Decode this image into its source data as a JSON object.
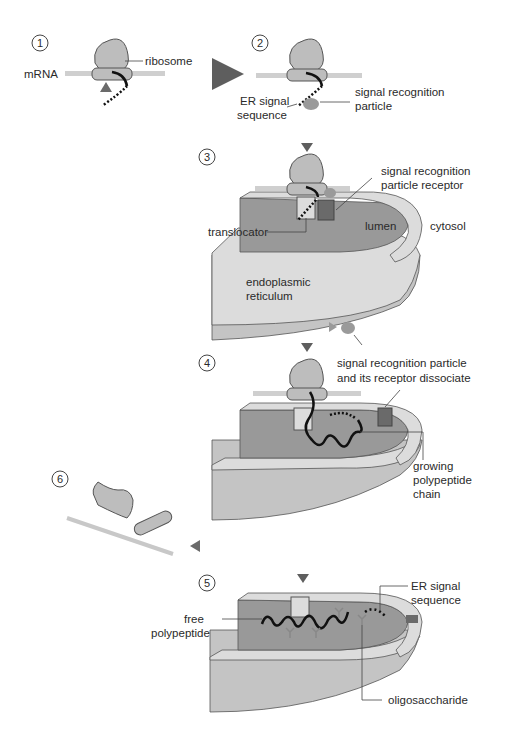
{
  "diagram": {
    "type": "process-flow",
    "colors": {
      "ribosome": "#bdbdbd",
      "mrna": "#c8c8c8",
      "srp": "#9a9a9a",
      "lumen": "#999999",
      "membrane_light": "#dcdcdc",
      "er_body": "#c4c4c4",
      "receptor": "#6a6a6a",
      "arrow": "#6e6e6e",
      "text": "#2a2a2a"
    },
    "steps": [
      {
        "number": "1",
        "labels": {
          "mrna": "mRNA",
          "ribosome": "ribosome"
        }
      },
      {
        "number": "2",
        "labels": {
          "er_signal": "ER signal",
          "er_signal_2": "sequence",
          "srp": "signal recognition",
          "srp_2": "particle"
        }
      },
      {
        "number": "3",
        "labels": {
          "receptor": "signal recognition",
          "receptor_2": "particle receptor",
          "translocator": "translocator",
          "lumen": "lumen",
          "cytosol": "cytosol",
          "er": "endoplasmic",
          "er_2": "reticulum"
        }
      },
      {
        "number": "4",
        "labels": {
          "dissociate": "signal recognition particle",
          "dissociate_2": "and its receptor dissociate",
          "chain": "growing",
          "chain_2": "polypeptide",
          "chain_3": "chain"
        }
      },
      {
        "number": "5",
        "labels": {
          "er_signal": "ER signal",
          "er_signal_2": "sequence",
          "free": "free",
          "free_2": "polypeptide",
          "oligo": "oligosaccharide"
        }
      },
      {
        "number": "6",
        "labels": {}
      }
    ]
  }
}
